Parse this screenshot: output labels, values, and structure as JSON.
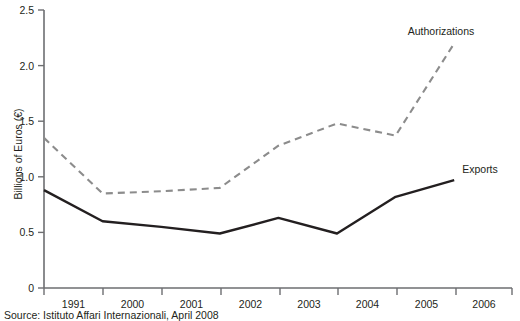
{
  "chart_data": {
    "type": "line",
    "title": "",
    "xlabel": "",
    "ylabel": "Billions of Euros (€)",
    "categories": [
      "1991",
      "2000",
      "2001",
      "2002",
      "2003",
      "2004",
      "2005",
      "2006"
    ],
    "ylim": [
      0,
      2.5
    ],
    "yticks": [
      "0",
      "0.5",
      "1.0",
      "1.5",
      "2.0",
      "2.5"
    ],
    "ytick_values": [
      0,
      0.5,
      1.0,
      1.5,
      2.0,
      2.5
    ],
    "grid": false,
    "legend_position": "inline-right",
    "series": [
      {
        "name": "Authorizations",
        "style": "dashed",
        "color": "#8c8c8c",
        "values": [
          1.35,
          0.85,
          0.87,
          0.9,
          1.28,
          1.48,
          1.37,
          2.2
        ]
      },
      {
        "name": "Exports",
        "style": "solid",
        "color": "#231f20",
        "values": [
          0.88,
          0.6,
          0.55,
          0.49,
          0.63,
          0.49,
          0.82,
          0.97
        ]
      }
    ],
    "annotations": [
      {
        "text": "Authorizations",
        "series": "Authorizations"
      },
      {
        "text": "Exports",
        "series": "Exports"
      }
    ]
  },
  "axis": {
    "y_title": "Billions of Euros (€)",
    "axis_color": "#6d6e71"
  },
  "labels": {
    "authorizations": "Authorizations",
    "exports": "Exports"
  },
  "footer": {
    "source": "Source: Istituto Affari Internazionali, April 2008"
  }
}
